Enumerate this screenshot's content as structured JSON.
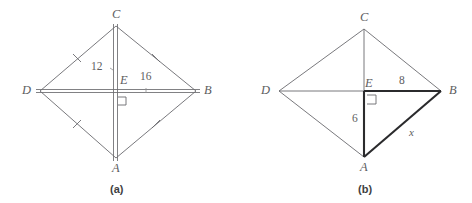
{
  "page": {
    "background_color": "#ffffff",
    "stroke_color": "#6a6a6e",
    "bold_stroke_color": "#2b2b2d",
    "label_color": "#5d5d60"
  },
  "figure_a": {
    "caption": "(a)",
    "vertices": {
      "C": "C",
      "D": "D",
      "B": "B",
      "A": "A",
      "E": "E"
    },
    "measures": {
      "ce_segment": "12",
      "eb_segment": "16"
    },
    "tick_marks": 4,
    "right_angle_at": "E",
    "shape": "rhombus with diagonals"
  },
  "figure_b": {
    "caption": "(b)",
    "vertices": {
      "C": "C",
      "D": "D",
      "B": "B",
      "A": "A",
      "E": "E"
    },
    "measures": {
      "eb_segment": "8",
      "ea_segment": "6",
      "ab_segment": "x"
    },
    "tick_marks": 0,
    "right_angle_at": "E",
    "shape": "rhombus with diagonals, triangle AEB highlighted"
  }
}
